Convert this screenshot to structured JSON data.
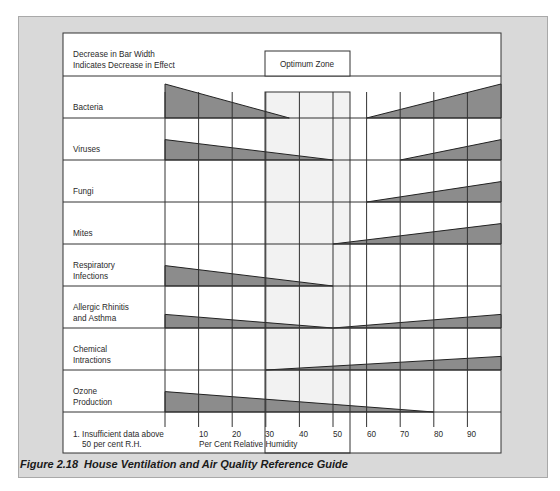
{
  "header": {
    "legend_line1": "Decrease in Bar Width",
    "legend_line2": "Indicates Decrease in Effect",
    "optimum_zone_label": "Optimum Zone"
  },
  "footer": {
    "footnote_line1": "1.  Insufficient data above",
    "footnote_line2": "50 per cent R.H.",
    "axis_label": "Per Cent Relative Humidity"
  },
  "caption": {
    "figure_number": "Figure  2.18",
    "title": "House Ventilation and Air Quality Reference Guide"
  },
  "colors": {
    "bar_fill": "#8c8c8c",
    "optimum_zone_fill": "#f2f2f2",
    "panel_bg": "#d9d9d9",
    "grid": "#333333"
  },
  "chart_data": {
    "type": "area",
    "title": "House Ventilation and Air Quality Reference Guide",
    "xlabel": "Per Cent Relative Humidity",
    "ylabel": "",
    "x_ticks": [
      10,
      20,
      30,
      40,
      50,
      60,
      70,
      80,
      90
    ],
    "xlim": [
      0,
      100
    ],
    "optimum_zone": [
      30,
      55
    ],
    "legend_note": "Decrease in Bar Width Indicates Decrease in Effect",
    "footnote": "1. Insufficient data above 50 per cent R.H.",
    "grid": true,
    "categories": [
      "Bacteria",
      "Viruses",
      "Fungi",
      "Mites",
      "Respiratory Infections",
      "Allergic Rhinitis and Asthma",
      "Chemical Intractions",
      "Ozone Production"
    ],
    "series": [
      {
        "name": "Bacteria",
        "segments": [
          {
            "from_rh": 0,
            "to_rh": 37,
            "start_width": 1.0,
            "end_width": 0.0
          },
          {
            "from_rh": 60,
            "to_rh": 100,
            "start_width": 0.0,
            "end_width": 1.0
          }
        ]
      },
      {
        "name": "Viruses",
        "segments": [
          {
            "from_rh": 0,
            "to_rh": 50,
            "start_width": 0.6,
            "end_width": 0.0
          },
          {
            "from_rh": 70,
            "to_rh": 100,
            "start_width": 0.0,
            "end_width": 0.6
          }
        ]
      },
      {
        "name": "Fungi",
        "segments": [
          {
            "from_rh": 60,
            "to_rh": 100,
            "start_width": 0.0,
            "end_width": 0.6
          }
        ]
      },
      {
        "name": "Mites",
        "segments": [
          {
            "from_rh": 50,
            "to_rh": 100,
            "start_width": 0.0,
            "end_width": 0.6
          }
        ]
      },
      {
        "name": "Respiratory Infections",
        "segments": [
          {
            "from_rh": 0,
            "to_rh": 50,
            "start_width": 0.6,
            "end_width": 0.0
          }
        ]
      },
      {
        "name": "Allergic Rhinitis and Asthma",
        "segments": [
          {
            "from_rh": 0,
            "to_rh": 50,
            "start_width": 0.4,
            "end_width": 0.0
          },
          {
            "from_rh": 50,
            "to_rh": 100,
            "start_width": 0.0,
            "end_width": 0.4
          }
        ]
      },
      {
        "name": "Chemical Intractions",
        "segments": [
          {
            "from_rh": 30,
            "to_rh": 100,
            "start_width": 0.0,
            "end_width": 0.4
          }
        ]
      },
      {
        "name": "Ozone Production",
        "segments": [
          {
            "from_rh": 0,
            "to_rh": 80,
            "start_width": 0.6,
            "end_width": 0.0
          }
        ]
      }
    ]
  },
  "rows": [
    {
      "line1": "Bacteria",
      "line2": ""
    },
    {
      "line1": "Viruses",
      "line2": ""
    },
    {
      "line1": "Fungi",
      "line2": ""
    },
    {
      "line1": "Mites",
      "line2": ""
    },
    {
      "line1": "Respiratory",
      "line2": "Infections"
    },
    {
      "line1": "Allergic Rhinitis",
      "line2": "and Asthma"
    },
    {
      "line1": "Chemical",
      "line2": "Intractions"
    },
    {
      "line1": "Ozone",
      "line2": "Production"
    }
  ],
  "ticks": [
    "10",
    "20",
    "30",
    "40",
    "50",
    "60",
    "70",
    "80",
    "90"
  ]
}
